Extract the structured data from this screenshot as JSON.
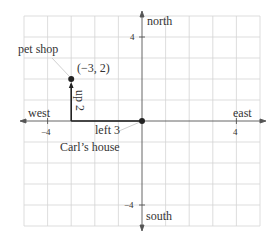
{
  "diagram": {
    "type": "coordinate-grid-map",
    "grid": {
      "x_min": -5,
      "x_max": 5,
      "y_min": -5,
      "y_max": 5,
      "color": "#d4d4d4"
    },
    "axes": {
      "north_label": "north",
      "south_label": "south",
      "east_label": "east",
      "west_label": "west",
      "tick_labels": {
        "x_neg": "−4",
        "x_pos": "4",
        "y_pos": "4",
        "y_neg": "−4"
      },
      "color": "#444444"
    },
    "points": [
      {
        "name": "pet shop",
        "x": -3,
        "y": 2,
        "label": "pet shop",
        "coord_label": "(−3, 2)"
      },
      {
        "name": "Carl's house",
        "x": 0,
        "y": 0,
        "label": "Carl’s house"
      }
    ],
    "moves": [
      {
        "label": "left 3",
        "from": [
          0,
          0
        ],
        "to": [
          -3,
          0
        ]
      },
      {
        "label": "up 2",
        "from": [
          -3,
          0
        ],
        "to": [
          -3,
          2
        ]
      }
    ],
    "path_color": "#222222"
  }
}
